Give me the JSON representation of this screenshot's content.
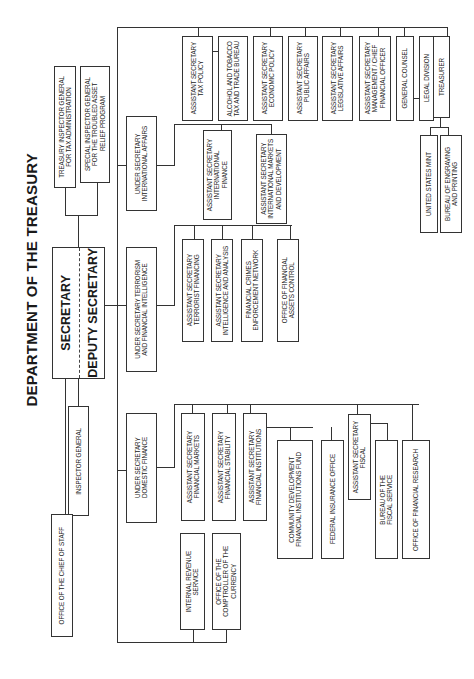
{
  "title": "DEPARTMENT OF THE TREASURY",
  "secretary": "SECRETARY",
  "deputy_secretary": "DEPUTY SECRETARY",
  "boxes": {
    "tigta": "TREASURY INSPECTOR GENERAL\nFOR TAX ADMINISTRATION",
    "sigtarp": "SPECIAL INSPECTOR GENERAL\nFOR THE TROUBLED ASSET\nRELIEF PROGRAM",
    "inspector_general": "INSPECTOR GENERAL",
    "chief_of_staff": "OFFICE OF THE CHIEF OF STAFF",
    "us_international": "UNDER SECRETARY\nINTERNATIONAL AFFAIRS",
    "us_terrorism": "UNDER SECRETARY TERRORISM\nAND FINANCIAL INTELLIGENCE",
    "us_domestic": "UNDER SECRETARY\nDOMESTIC FINANCE",
    "irs": "INTERNAL REVENUE\nSERVICE",
    "occ": "OFFICE OF THE\nCOMPTROLLER OF THE\nCURRENCY",
    "as_tax_policy": "ASSISTANT SECRETARY\nTAX POLICY",
    "ttb": "ALCOHOL AND TOBACCO\nTAX AND TRADE BUREAU",
    "as_economic_policy": "ASSISTANT SECRETARY\nECONOMIC POLICY",
    "as_public_affairs": "ASSISTANT SECRETARY\nPUBLIC AFFAIRS",
    "as_legislative_affairs": "ASSISTANT SECRETARY\nLEGISLATIVE AFFAIRS",
    "as_management": "ASSISTANT SECRETARY\nMANAGEMENT / CHIEF\nFINANCIAL OFFICER",
    "general_counsel": "GENERAL COUNSEL",
    "legal_division": "LEGAL DIVISION",
    "treasurer": "TREASURER",
    "us_mint": "UNITED STATES MINT",
    "bep": "BUREAU OF ENGRAVING\nAND PRINTING",
    "as_international_finance": "ASSISTANT SECRETARY\nINTERNATIONAL\nFINANCE",
    "as_international_markets": "ASSISTANT SECRETARY\nINTERNATIONAL MARKETS\nAND DEVELOPMENT",
    "as_terrorist_financing": "ASSISTANT SECRETARY\nTERRORIST FINANCING",
    "as_intelligence": "ASSISTANT SECRETARY\nINTELLIGENCE AND ANALYSIS",
    "fincen": "FINANCIAL CRIMES\nENFORCEMENT NETWORK",
    "ofac": "OFFICE OF FINANCIAL\nASSETS CONTROL",
    "as_financial_markets": "ASSISTANT SECRETARY\nFINANCIAL MARKETS",
    "as_financial_stability": "ASSISTANT SECRETARY\nFINANCIAL STABILITY",
    "as_financial_institutions": "ASSISTANT SECRETARY\nFINANCIAL INSTITUTIONS",
    "cdfi": "COMMUNITY DEVELOPMENT\nFINANCIAL INSTITUTIONS FUND",
    "fio": "FEDERAL INSURANCE OFFICE",
    "as_fiscal": "ASSISTANT SECRETARY\nFISCAL",
    "fiscal_service": "BUREAU OF THE\nFISCAL SERVICE",
    "ofr": "OFFICE OF FINANCIAL RESEARCH"
  }
}
